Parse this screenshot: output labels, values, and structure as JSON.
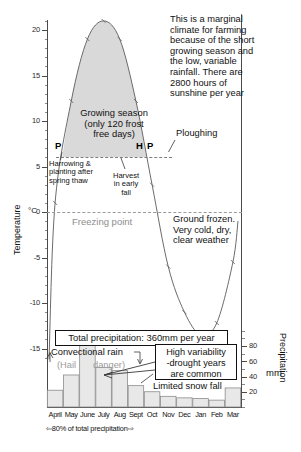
{
  "chart_data": {
    "type": "line",
    "categories": [
      "April",
      "May",
      "June",
      "July",
      "Aug",
      "Sept",
      "Oct",
      "Nov",
      "Dec",
      "Jan",
      "Feb",
      "Mar"
    ],
    "series": [
      {
        "name": "Temperature",
        "unit": "°C",
        "type": "line",
        "axis": "left",
        "values": [
          1.0,
          12.2,
          19.0,
          21.0,
          19.0,
          12.2,
          3.0,
          -6.0,
          -11.0,
          -13.5,
          -12.2,
          -5.5
        ]
      },
      {
        "name": "Precipitation",
        "unit": "mm",
        "type": "bar",
        "axis": "right",
        "values": [
          22,
          42,
          85,
          52,
          48,
          28,
          20,
          14,
          12,
          11,
          9,
          25
        ]
      }
    ],
    "ylabel": "Temperature",
    "ylabel_right": "Precipitation",
    "yunit_right": "mm",
    "ylim": [
      -16.5,
      22.5
    ],
    "yticks": [
      20,
      15,
      10,
      5,
      0,
      -5,
      -10,
      -15
    ],
    "ylim_right": [
      0,
      100
    ],
    "yticks_right": [
      80,
      60,
      40,
      20
    ],
    "grid": false,
    "legend": false,
    "freezing_point_value": 0
  },
  "axes": {
    "left_title": "Temperature",
    "right_title": "Precipitation",
    "right_unit": "mm",
    "degree_symbol": "°C",
    "temp_ticks": [
      "20",
      "15",
      "10",
      "5",
      "0",
      "-5",
      "-10",
      "-15"
    ],
    "precip_ticks": [
      "80",
      "60",
      "40",
      "20"
    ]
  },
  "months": [
    "April",
    "May",
    "June",
    "July",
    "Aug",
    "Sept",
    "Oct",
    "Nov",
    "Dec",
    "Jan",
    "Feb",
    "Mar"
  ],
  "annotations": {
    "intro": "This is a marginal\nclimate for farming\nbecause of the short\ngrowing season and\nthe low, variable\nrainfall. There are\n2800 hours of\nsunshine per year",
    "growing_season": "Growing season\n(only 120 frost\nfree days)",
    "ploughing": "Ploughing",
    "marker_p_spring": "P",
    "marker_h": "H",
    "marker_p_fall": "P",
    "harrowing": "Harrowing &\nplanting after\nspring thaw",
    "harvest": "Harvest\nin early\nfall",
    "freezing_point": "Freezing point",
    "ground_frozen": "Ground frozen.\nVery cold, dry,\nclear weather",
    "total_precip": "Total precipitation: 360mm per year",
    "convectional_rain": "Convectional rain",
    "hail": "(Hail",
    "danger": "danger)",
    "high_variability": "High variability\n-drought years\nare common",
    "limited_snow": "Limited snow fall",
    "pct_precip": "80% of total precipitation",
    "arrow_left": "⇦",
    "arrow_right": "⇨"
  },
  "colors": {
    "growing_season_fill": "#d9d9d9",
    "bar_fill": "#e8e8e8",
    "bar_stroke": "#8c8c8c",
    "curve": "#5a5a5a",
    "axis": "#4a4a4a",
    "freeze_dash": "#9a9a9a",
    "grey_text": "#9b9b9b"
  }
}
